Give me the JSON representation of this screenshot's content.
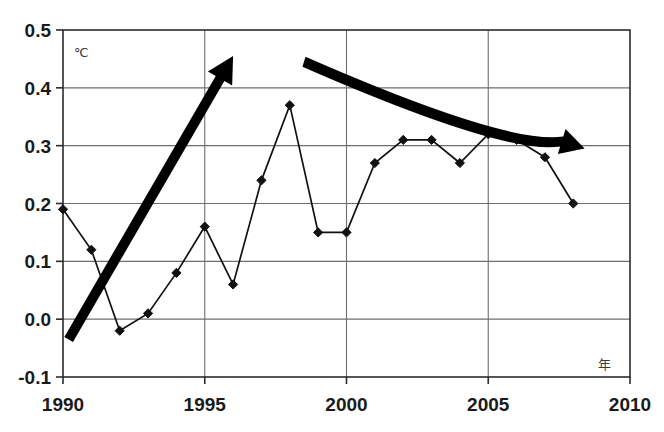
{
  "chart_data": {
    "type": "line",
    "title": "",
    "subtitle": "",
    "xlabel": "年",
    "ylabel": "℃",
    "xlim": [
      1990,
      2010
    ],
    "ylim": [
      -0.1,
      0.5
    ],
    "grid": true,
    "legend": "none",
    "x": [
      1990,
      1991,
      1992,
      1993,
      1994,
      1995,
      1996,
      1997,
      1998,
      1999,
      2000,
      2001,
      2002,
      2003,
      2004,
      2005,
      2006,
      2007,
      2008
    ],
    "series": [
      {
        "name": "temperature-anomaly",
        "marker": "diamond",
        "values": [
          0.19,
          0.12,
          -0.02,
          0.01,
          0.08,
          0.16,
          0.06,
          0.24,
          0.37,
          0.15,
          0.15,
          0.27,
          0.31,
          0.31,
          0.27,
          0.32,
          0.31,
          0.28,
          0.2
        ]
      }
    ],
    "x_ticks": [
      1990,
      1995,
      2000,
      2005,
      2010
    ],
    "x_tick_labels": [
      "1990",
      "1995",
      "2000",
      "2005",
      "2010"
    ],
    "y_ticks": [
      -0.1,
      0.0,
      0.1,
      0.2,
      0.3,
      0.4,
      0.5
    ],
    "y_tick_labels": [
      "-0.1",
      "0.0",
      "0.1",
      "0.2",
      "0.3",
      "0.4",
      "0.5"
    ],
    "annotations": [
      {
        "name": "rising-trend-arrow",
        "kind": "arrow",
        "direction": "up-right",
        "from": [
          1990.2,
          -0.035
        ],
        "to": [
          1996.0,
          0.455
        ],
        "color": "#000000"
      },
      {
        "name": "falling-trend-arrow",
        "kind": "arrow",
        "direction": "down-right",
        "from": [
          1998.5,
          0.445
        ],
        "to": [
          2008.4,
          0.295
        ],
        "color": "#000000"
      }
    ]
  },
  "axes": {
    "y_unit": "℃",
    "x_unit": "年"
  },
  "colors": {
    "line": "#111111",
    "grid": "#6e6e6e",
    "frame": "#2b2b2b",
    "arrow": "#000000",
    "background": "#ffffff"
  }
}
